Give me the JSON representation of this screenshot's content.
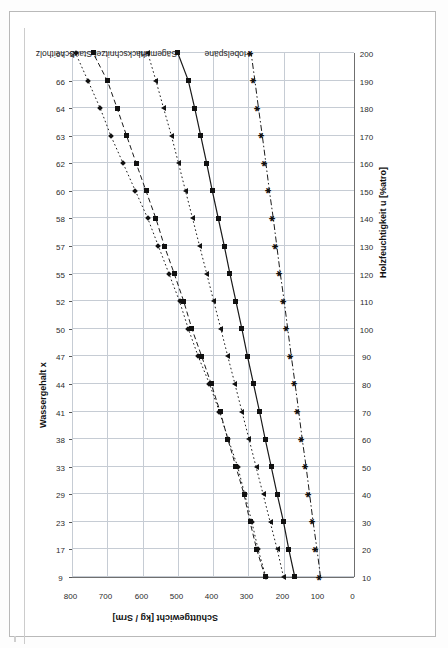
{
  "chart_data": {
    "type": "line",
    "title": "",
    "xlabel_top": "Wassergehalt x",
    "xlabel_bottom": "Holzfeuchtigkeit u [%atro]",
    "ylabel": "Schüttgewicht [kg / Srm]",
    "grid": true,
    "legend_position": "inline-top-labels",
    "ylim": [
      0,
      800
    ],
    "yticks": [
      800,
      700,
      600,
      500,
      400,
      300,
      200,
      100,
      0
    ],
    "x_bottom": [
      10,
      20,
      30,
      40,
      50,
      60,
      70,
      80,
      90,
      100,
      110,
      120,
      130,
      140,
      150,
      160,
      170,
      180,
      190,
      200
    ],
    "x_top_watercontent": [
      9,
      17,
      23,
      29,
      33,
      38,
      41,
      44,
      47,
      50,
      52,
      55,
      57,
      58,
      60,
      62,
      63,
      64,
      66,
      67
    ],
    "series": [
      {
        "name": "Scheitholz",
        "marker": "diamond",
        "line": "dotted",
        "values": [
          250,
          272,
          290,
          310,
          330,
          357,
          382,
          410,
          442,
          470,
          495,
          525,
          555,
          585,
          620,
          655,
          690,
          720,
          755,
          790
        ]
      },
      {
        "name": "Staub",
        "marker": "square",
        "line": "dashed",
        "values": [
          252,
          276,
          295,
          312,
          335,
          358,
          380,
          405,
          432,
          460,
          483,
          510,
          538,
          562,
          590,
          618,
          645,
          672,
          700,
          740
        ]
      },
      {
        "name": "Hackschnitzel",
        "marker": "triangle",
        "line": "dotted",
        "values": [
          200,
          218,
          238,
          258,
          278,
          298,
          318,
          338,
          358,
          378,
          398,
          418,
          438,
          458,
          478,
          498,
          518,
          540,
          562,
          585
        ]
      },
      {
        "name": "Sägemehl",
        "marker": "square",
        "line": "solid",
        "values": [
          168,
          185,
          200,
          218,
          235,
          252,
          268,
          285,
          302,
          318,
          335,
          352,
          368,
          385,
          402,
          418,
          435,
          452,
          470,
          500
        ]
      },
      {
        "name": "Hobelspäne",
        "marker": "star",
        "line": "dashdot",
        "values": [
          95,
          105,
          116,
          126,
          136,
          147,
          157,
          167,
          178,
          188,
          198,
          209,
          219,
          229,
          240,
          250,
          260,
          271,
          281,
          292
        ]
      }
    ]
  },
  "axes": {
    "top_title": "Wassergehalt x",
    "bottom_title": "Holzfeuchtigkeit u [%atro]",
    "value_title": "Schüttgewicht [kg / Srm]"
  }
}
